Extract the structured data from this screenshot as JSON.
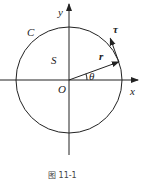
{
  "diagram": {
    "labels": {
      "curve": "C",
      "region": "S",
      "origin": "O",
      "x_axis": "x",
      "y_axis": "y",
      "radius_vector": "r",
      "tangent_vector": "τ",
      "angle": "θ"
    },
    "angle_deg": 20,
    "caption": "图 11-1"
  }
}
